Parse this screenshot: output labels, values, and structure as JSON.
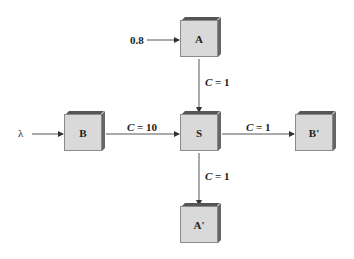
{
  "diagram": {
    "nodes": [
      {
        "id": "A",
        "label": "A"
      },
      {
        "id": "B",
        "label": "B"
      },
      {
        "id": "S",
        "label": "S"
      },
      {
        "id": "B_prime",
        "label": "B'"
      },
      {
        "id": "A_prime",
        "label": "A'"
      }
    ],
    "inputs": {
      "a_input": "0.8",
      "b_input": "λ"
    },
    "edges": [
      {
        "from": "input",
        "to": "A",
        "label": "0.8"
      },
      {
        "from": "input",
        "to": "B",
        "label": "λ"
      },
      {
        "from": "A",
        "to": "S",
        "label_var": "C",
        "label_val": " = 1"
      },
      {
        "from": "B",
        "to": "S",
        "label_var": "C",
        "label_val": " = 10"
      },
      {
        "from": "S",
        "to": "B'",
        "label_var": "C",
        "label_val": " = 1"
      },
      {
        "from": "S",
        "to": "A'",
        "label_var": "C",
        "label_val": " = 1"
      }
    ]
  }
}
